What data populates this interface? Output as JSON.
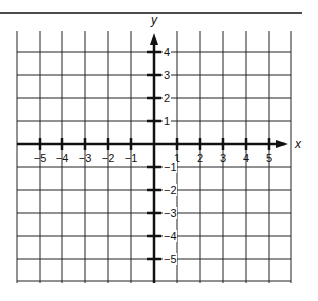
{
  "diagram": {
    "type": "coordinate-plane",
    "x_axis_label": "x",
    "y_axis_label": "y",
    "x_ticks": [
      {
        "value": -5,
        "label": "−5"
      },
      {
        "value": -4,
        "label": "−4"
      },
      {
        "value": -3,
        "label": "−3"
      },
      {
        "value": -2,
        "label": "−2"
      },
      {
        "value": -1,
        "label": "−1"
      },
      {
        "value": 1,
        "label": "1"
      },
      {
        "value": 2,
        "label": "2"
      },
      {
        "value": 3,
        "label": "3"
      },
      {
        "value": 4,
        "label": "4"
      },
      {
        "value": 5,
        "label": "5"
      }
    ],
    "y_ticks": [
      {
        "value": 4,
        "label": "4"
      },
      {
        "value": 3,
        "label": "3"
      },
      {
        "value": 2,
        "label": "2"
      },
      {
        "value": 1,
        "label": "1"
      },
      {
        "value": -1,
        "label": "−1"
      },
      {
        "value": -2,
        "label": "−2"
      },
      {
        "value": -3,
        "label": "−3"
      },
      {
        "value": -4,
        "label": "−4"
      },
      {
        "value": -5,
        "label": "−5"
      }
    ],
    "x_range": [
      -6,
      6
    ],
    "y_range": [
      -6,
      5
    ],
    "grid": true,
    "colors": {
      "line": "#111111",
      "background": "#ffffff"
    }
  }
}
